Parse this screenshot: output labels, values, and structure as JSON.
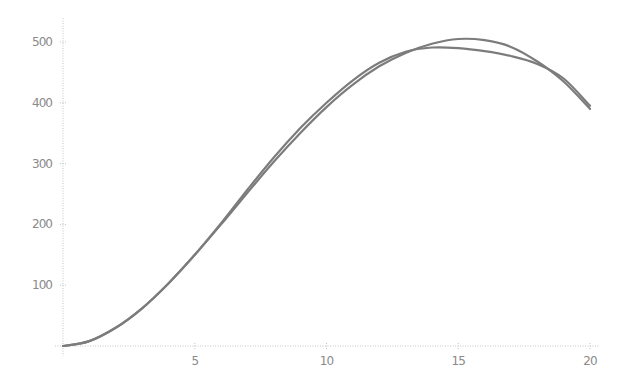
{
  "chart_data": {
    "type": "line",
    "title": "",
    "xlabel": "",
    "ylabel": "",
    "xlim": [
      0,
      20
    ],
    "ylim": [
      0,
      530
    ],
    "grid": false,
    "legend": null,
    "x_ticks": [
      5,
      10,
      15,
      20
    ],
    "x_tick_labels": [
      "5",
      "10",
      "15",
      "20"
    ],
    "y_ticks": [
      100,
      200,
      300,
      400,
      500
    ],
    "y_tick_labels": [
      "100",
      "200",
      "300",
      "400",
      "500"
    ],
    "series": [
      {
        "name": "curve-a",
        "color": "#7c7c7c",
        "x": [
          0,
          1,
          2,
          3,
          4,
          5,
          6,
          7,
          8,
          9,
          10,
          11,
          12,
          13,
          14,
          15,
          16,
          17,
          18,
          19,
          20
        ],
        "y": [
          0,
          8,
          30,
          62,
          103,
          150,
          200,
          252,
          303,
          350,
          393,
          430,
          460,
          482,
          497,
          505,
          503,
          492,
          468,
          435,
          390
        ]
      },
      {
        "name": "curve-b",
        "color": "#7c7c7c",
        "x": [
          0,
          1,
          2,
          3,
          4,
          5,
          6,
          7,
          8,
          9,
          10,
          11,
          12,
          13,
          14,
          15,
          16,
          17,
          18,
          19,
          20
        ],
        "y": [
          0,
          8,
          30,
          62,
          103,
          150,
          202,
          257,
          310,
          358,
          400,
          437,
          466,
          484,
          491,
          490,
          485,
          477,
          464,
          440,
          395
        ]
      }
    ]
  }
}
